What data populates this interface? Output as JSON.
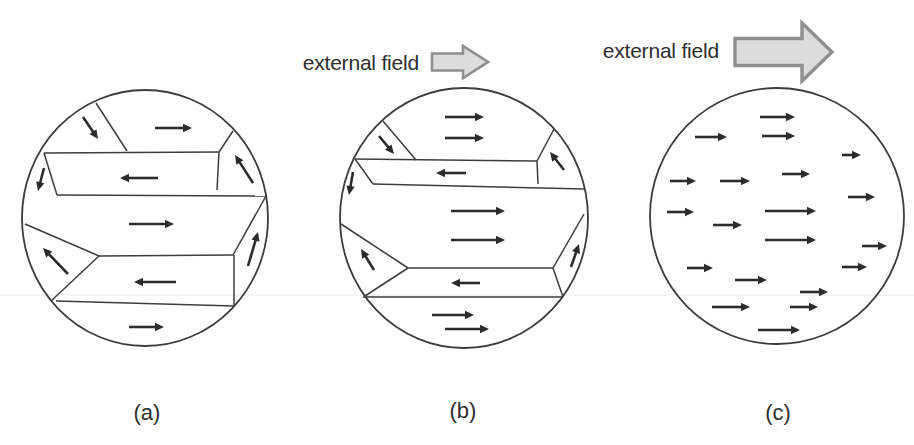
{
  "figure": {
    "title_visible": false,
    "colors": {
      "outline": "#3d3d3d",
      "domain_wall": "#3d3d3d",
      "magnetization_arrow": "#2c2c2c",
      "field_arrow_fill": "#dcdcdc",
      "field_arrow_border": "#8f8f8f",
      "text": "#2e2e2e",
      "scan_artifact_line": "#eceae7",
      "background": "#ffffff"
    },
    "field_labels": [
      {
        "text": "external field",
        "for_panel": "(b)"
      },
      {
        "text": "external field",
        "for_panel": "(c)"
      }
    ],
    "field_arrows": [
      {
        "icon": "block-arrow-right",
        "for_panel": "(b)",
        "x": 432,
        "cy": 62,
        "body_w": 31,
        "body_h": 17,
        "head_w": 25,
        "head_h": 32,
        "border_w": 2.6
      },
      {
        "icon": "block-arrow-right",
        "for_panel": "(c)",
        "x": 735,
        "cy": 52,
        "body_w": 67,
        "body_h": 27,
        "head_w": 30,
        "head_h": 58,
        "border_w": 3.4
      }
    ],
    "scan_artifact_line": {
      "y": 295,
      "x1": 0,
      "x2": 914
    },
    "panels": [
      {
        "label": "(a)",
        "ellipse": {
          "cx": 145,
          "cy": 218,
          "rx": 123,
          "ry": 128
        },
        "walls": [
          [
            96,
            103,
            127,
            151
          ],
          [
            44,
            153,
            219,
            152
          ],
          [
            219,
            152,
            233,
            131
          ],
          [
            219,
            152,
            217,
            190
          ],
          [
            57,
            195,
            266,
            196
          ],
          [
            44,
            153,
            57,
            195
          ],
          [
            99,
            256,
            233,
            255
          ],
          [
            233,
            255,
            266,
            196
          ],
          [
            25,
            224,
            99,
            256
          ],
          [
            51,
            301,
            99,
            256
          ],
          [
            56,
            301,
            234,
            306
          ],
          [
            234,
            255,
            234,
            306
          ]
        ],
        "arrows": [
          [
            83,
            117,
            98,
            139
          ],
          [
            155,
            128,
            192,
            128
          ],
          [
            158,
            178,
            120,
            178
          ],
          [
            253,
            183,
            235,
            155
          ],
          [
            44,
            168,
            38,
            191
          ],
          [
            129,
            224,
            174,
            224
          ],
          [
            68,
            274,
            43,
            248
          ],
          [
            176,
            282,
            134,
            282
          ],
          [
            248,
            266,
            258,
            232
          ],
          [
            129,
            327,
            164,
            327
          ]
        ]
      },
      {
        "label": "(b)",
        "ellipse": {
          "cx": 464,
          "cy": 218,
          "rx": 124,
          "ry": 130
        },
        "walls": [
          [
            383,
            121,
            416,
            160
          ],
          [
            355,
            159,
            537,
            161
          ],
          [
            537,
            161,
            554,
            129
          ],
          [
            537,
            161,
            538,
            184
          ],
          [
            373,
            184,
            585,
            189
          ],
          [
            355,
            159,
            373,
            184
          ],
          [
            408,
            268,
            553,
            268
          ],
          [
            553,
            268,
            584,
            214
          ],
          [
            341,
            224,
            408,
            268
          ],
          [
            365,
            296,
            408,
            268
          ],
          [
            363,
            297,
            563,
            297
          ],
          [
            553,
            268,
            563,
            297
          ]
        ],
        "arrows": [
          [
            445,
            117,
            484,
            117
          ],
          [
            445,
            138,
            484,
            138
          ],
          [
            379,
            136,
            394,
            154
          ],
          [
            466,
            173,
            436,
            173
          ],
          [
            564,
            170,
            550,
            152
          ],
          [
            353,
            172,
            349,
            195
          ],
          [
            451,
            211,
            505,
            211
          ],
          [
            451,
            240,
            505,
            240
          ],
          [
            374,
            270,
            361,
            249
          ],
          [
            480,
            283,
            451,
            283
          ],
          [
            571,
            267,
            579,
            244
          ],
          [
            432,
            315,
            474,
            315
          ],
          [
            445,
            329,
            489,
            329
          ]
        ]
      },
      {
        "label": "(c)",
        "ellipse": {
          "cx": 777,
          "cy": 216,
          "rx": 127,
          "ry": 128
        },
        "walls": [],
        "arrows": [
          [
            760,
            117,
            795,
            117
          ],
          [
            695,
            137,
            727,
            137
          ],
          [
            762,
            136,
            795,
            136
          ],
          [
            842,
            155,
            861,
            155
          ],
          [
            670,
            181,
            696,
            181
          ],
          [
            720,
            181,
            750,
            181
          ],
          [
            782,
            174,
            810,
            174
          ],
          [
            848,
            197,
            875,
            197
          ],
          [
            667,
            212,
            694,
            212
          ],
          [
            713,
            225,
            742,
            225
          ],
          [
            765,
            211,
            816,
            211
          ],
          [
            765,
            240,
            816,
            240
          ],
          [
            862,
            246,
            887,
            246
          ],
          [
            842,
            267,
            867,
            267
          ],
          [
            687,
            268,
            713,
            268
          ],
          [
            735,
            280,
            767,
            280
          ],
          [
            800,
            292,
            828,
            292
          ],
          [
            712,
            307,
            750,
            307
          ],
          [
            790,
            307,
            818,
            307
          ],
          [
            758,
            330,
            800,
            330
          ]
        ]
      }
    ]
  }
}
